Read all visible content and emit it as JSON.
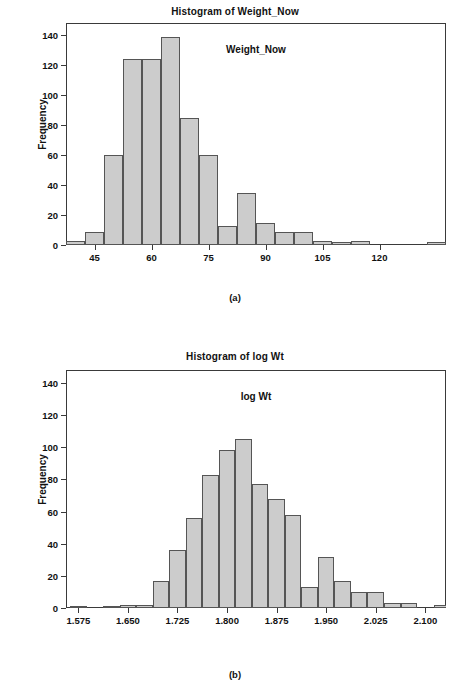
{
  "figures": [
    {
      "id": "a",
      "caption": "(a)",
      "chart_data": {
        "type": "bar",
        "title": "Histogram of Weight_Now",
        "xlabel": "Weight_Now",
        "ylabel": "Frequency",
        "xlim": [
          37.5,
          137.5
        ],
        "ylim": [
          0,
          148
        ],
        "xticks": [
          45,
          60,
          75,
          90,
          105,
          120
        ],
        "xtick_labels": [
          "45",
          "60",
          "75",
          "90",
          "105",
          "120"
        ],
        "yticks": [
          0,
          20,
          40,
          60,
          80,
          100,
          120,
          140
        ],
        "ytick_labels": [
          "0",
          "20",
          "40",
          "60",
          "80",
          "100",
          "120",
          "140"
        ],
        "grid": false,
        "legend": "none",
        "bin_width": 5,
        "bin_starts": [
          37.5,
          42.5,
          47.5,
          52.5,
          57.5,
          62.5,
          67.5,
          72.5,
          77.5,
          82.5,
          87.5,
          92.5,
          97.5,
          102.5,
          107.5,
          112.5,
          117.5,
          122.5,
          127.5,
          132.5
        ],
        "bin_centers": [
          40,
          45,
          50,
          55,
          60,
          65,
          70,
          75,
          80,
          85,
          90,
          95,
          100,
          105,
          110,
          115,
          120,
          125,
          130,
          135
        ],
        "values": [
          3,
          9,
          60,
          124,
          124,
          139,
          85,
          60,
          13,
          35,
          15,
          9,
          9,
          3,
          2,
          3,
          0,
          0,
          0,
          2
        ]
      }
    },
    {
      "id": "b",
      "caption": "(b)",
      "chart_data": {
        "type": "bar",
        "title": "Histogram of log Wt",
        "xlabel": "log Wt",
        "ylabel": "Frequency",
        "xlim": [
          1.5563,
          2.1313
        ],
        "ylim": [
          0,
          148
        ],
        "xticks": [
          1.575,
          1.65,
          1.725,
          1.8,
          1.875,
          1.95,
          2.025,
          2.1
        ],
        "xtick_labels": [
          "1.575",
          "1.650",
          "1.725",
          "1.800",
          "1.875",
          "1.950",
          "2.025",
          "2.100"
        ],
        "yticks": [
          0,
          20,
          40,
          60,
          80,
          100,
          120,
          140
        ],
        "ytick_labels": [
          "0",
          "20",
          "40",
          "60",
          "80",
          "100",
          "120",
          "140"
        ],
        "grid": false,
        "legend": "none",
        "bin_width": 0.025,
        "bin_starts": [
          1.5625,
          1.5875,
          1.6125,
          1.6375,
          1.6625,
          1.6875,
          1.7125,
          1.7375,
          1.7625,
          1.7875,
          1.8125,
          1.8375,
          1.8625,
          1.8875,
          1.9125,
          1.9375,
          1.9625,
          1.9875,
          2.0125,
          2.0375,
          2.0625,
          2.0875,
          2.1125
        ],
        "bin_centers": [
          1.575,
          1.6,
          1.625,
          1.65,
          1.675,
          1.7,
          1.725,
          1.75,
          1.775,
          1.8,
          1.825,
          1.85,
          1.875,
          1.9,
          1.925,
          1.95,
          1.975,
          2.0,
          2.025,
          2.05,
          2.075,
          2.1,
          2.125
        ],
        "values": [
          1,
          0,
          1,
          2,
          2,
          17,
          36,
          56,
          83,
          98,
          105,
          77,
          68,
          58,
          13,
          32,
          17,
          10,
          10,
          3,
          3,
          0,
          2
        ]
      }
    }
  ],
  "style": {
    "bar_fill": "#cccccc",
    "bar_stroke": "#555555",
    "axis_color": "#3a3a3a",
    "text_color": "#111111",
    "background": "#ffffff"
  }
}
